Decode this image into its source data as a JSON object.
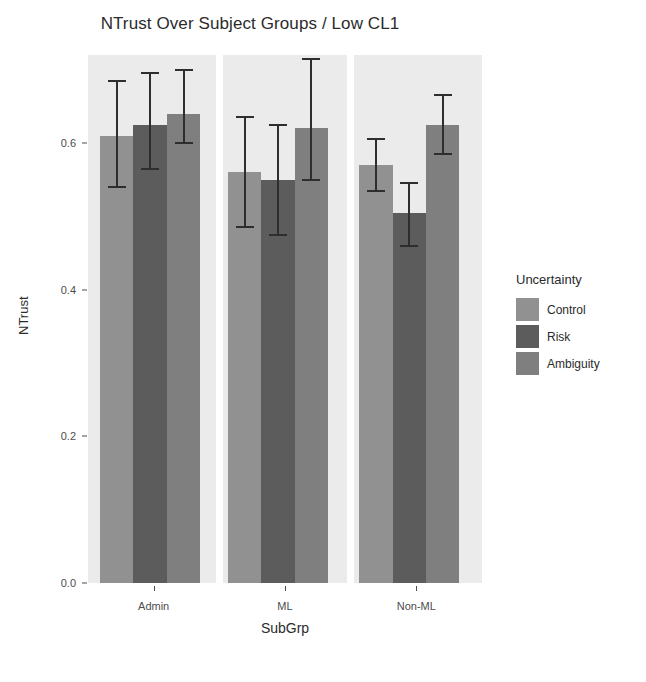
{
  "chart_data": {
    "type": "bar",
    "title": "NTrust Over Subject Groups / Low CL1",
    "xlabel": "SubGrp",
    "ylabel": "NTrust",
    "categories": [
      "Admin",
      "ML",
      "Non-ML"
    ],
    "ylim": [
      0.0,
      0.72
    ],
    "yticks": [
      0.0,
      0.2,
      0.4,
      0.6
    ],
    "ytick_labels": [
      "0.0",
      "0.2",
      "0.4",
      "0.6"
    ],
    "grid": false,
    "legend_title": "Uncertainty",
    "legend_position": "right",
    "series": [
      {
        "name": "Control",
        "color": "#919191",
        "values": [
          0.61,
          0.56,
          0.57
        ],
        "err_low": [
          0.54,
          0.485,
          0.535
        ],
        "err_high": [
          0.685,
          0.635,
          0.605
        ]
      },
      {
        "name": "Risk",
        "color": "#5c5c5c",
        "values": [
          0.625,
          0.55,
          0.505
        ],
        "err_low": [
          0.565,
          0.475,
          0.46
        ],
        "err_high": [
          0.695,
          0.625,
          0.545
        ]
      },
      {
        "name": "Ambiguity",
        "color": "#7f7f7f",
        "values": [
          0.64,
          0.62,
          0.625
        ],
        "err_low": [
          0.6,
          0.55,
          0.585
        ],
        "err_high": [
          0.7,
          0.715,
          0.665
        ]
      }
    ]
  },
  "legend": {
    "title": "Uncertainty",
    "items": [
      {
        "label": "Control",
        "color": "#919191"
      },
      {
        "label": "Risk",
        "color": "#5c5c5c"
      },
      {
        "label": "Ambiguity",
        "color": "#7f7f7f"
      }
    ]
  },
  "axes": {
    "y_title": "NTrust",
    "x_title": "SubGrp",
    "y_labels": [
      "0.6",
      "0.4",
      "0.2",
      "0.0"
    ],
    "x_labels": [
      "Admin",
      "ML",
      "Non-ML"
    ]
  },
  "colors": {
    "panel_background": "#ebebeb",
    "page_background": "#ffffff",
    "error_bar": "#2e2e2e",
    "text": "#2b2b2b",
    "tick_text": "#4d4d4d"
  }
}
